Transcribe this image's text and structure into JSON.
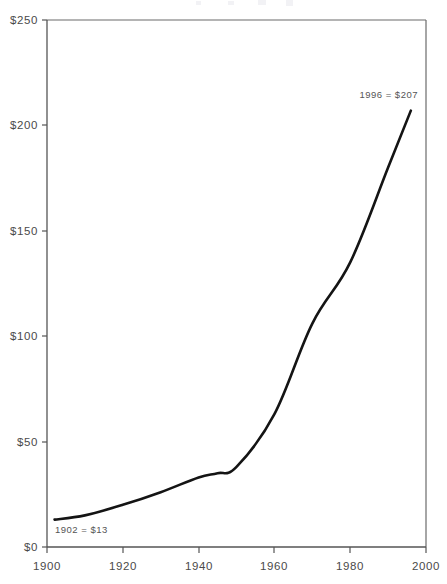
{
  "chart_data": {
    "type": "line",
    "title": "",
    "xlabel": "",
    "ylabel": "",
    "xlim": [
      1900,
      2000
    ],
    "ylim": [
      0,
      250
    ],
    "grid": false,
    "legend": "none",
    "x_ticks": [
      "1900",
      "1920",
      "1940",
      "1960",
      "1980",
      "2000"
    ],
    "x_tick_values": [
      1900,
      1920,
      1940,
      1960,
      1980,
      2000
    ],
    "y_ticks": [
      "$0",
      "$50",
      "$100",
      "$150",
      "$200",
      "$250"
    ],
    "y_tick_values": [
      0,
      50,
      100,
      150,
      200,
      250
    ],
    "series": [
      {
        "name": "value",
        "x": [
          1902,
          1910,
          1920,
          1930,
          1940,
          1945,
          1950,
          1960,
          1970,
          1980,
          1990,
          1996
        ],
        "values": [
          13,
          15,
          20,
          26,
          33,
          35,
          38,
          63,
          106,
          135,
          180,
          207
        ]
      }
    ],
    "annotations": [
      {
        "id": "start-annotation",
        "text": "1902 = $13",
        "x": 1902,
        "y": 13
      },
      {
        "id": "end-annotation",
        "text": "1996 = $207",
        "x": 1996,
        "y": 207
      }
    ]
  },
  "axis": {
    "y_label_0": "$0",
    "y_label_50": "$50",
    "y_label_100": "$100",
    "y_label_150": "$150",
    "y_label_200": "$200",
    "y_label_250": "$250",
    "x_label_1900": "1900",
    "x_label_1920": "1920",
    "x_label_1940": "1940",
    "x_label_1960": "1960",
    "x_label_1980": "1980",
    "x_label_2000": "2000"
  },
  "annotations": {
    "start": "1902 = $13",
    "end": "1996 = $207"
  },
  "colors": {
    "line": "#141414",
    "axis": "#555555",
    "frame": "#6b6b6b",
    "text": "#4a4a4a",
    "background": "#ffffff"
  }
}
